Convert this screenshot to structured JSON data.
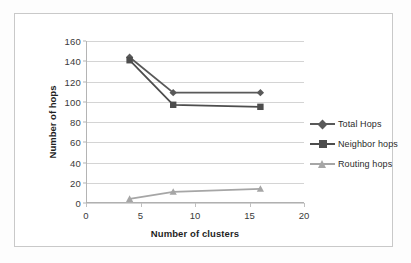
{
  "chart_data": {
    "type": "line",
    "title": "",
    "xlabel": "Number of clusters",
    "ylabel": "Number of hops",
    "x": [
      4,
      8,
      16
    ],
    "xlim": [
      0,
      20
    ],
    "ylim": [
      0,
      160
    ],
    "xticks": [
      "0",
      "5",
      "10",
      "15",
      "20"
    ],
    "xtick_values": [
      0,
      5,
      10,
      15,
      20
    ],
    "yticks": [
      "0",
      "20",
      "40",
      "60",
      "80",
      "100",
      "120",
      "140",
      "160"
    ],
    "ytick_values": [
      0,
      20,
      40,
      60,
      80,
      100,
      120,
      140,
      160
    ],
    "grid": "horizontal",
    "legend_position": "right",
    "series": [
      {
        "name": "Total Hops",
        "marker": "diamond",
        "color": "#595959",
        "values": [
          144,
          109,
          109
        ]
      },
      {
        "name": "Neighbor hops",
        "marker": "square",
        "color": "#4d4d4d",
        "values": [
          141,
          97,
          95
        ]
      },
      {
        "name": "Routing hops",
        "marker": "triangle",
        "color": "#a6a6a6",
        "values": [
          4,
          11,
          14
        ]
      }
    ]
  },
  "legend": {
    "items": [
      {
        "label": "Total Hops",
        "color": "#595959",
        "marker": "diamond"
      },
      {
        "label": "Neighbor hops",
        "color": "#4d4d4d",
        "marker": "square"
      },
      {
        "label": "Routing hops",
        "color": "#a6a6a6",
        "marker": "triangle"
      }
    ]
  },
  "axes": {
    "x_title": "Number of clusters",
    "y_title": "Number of hops"
  }
}
